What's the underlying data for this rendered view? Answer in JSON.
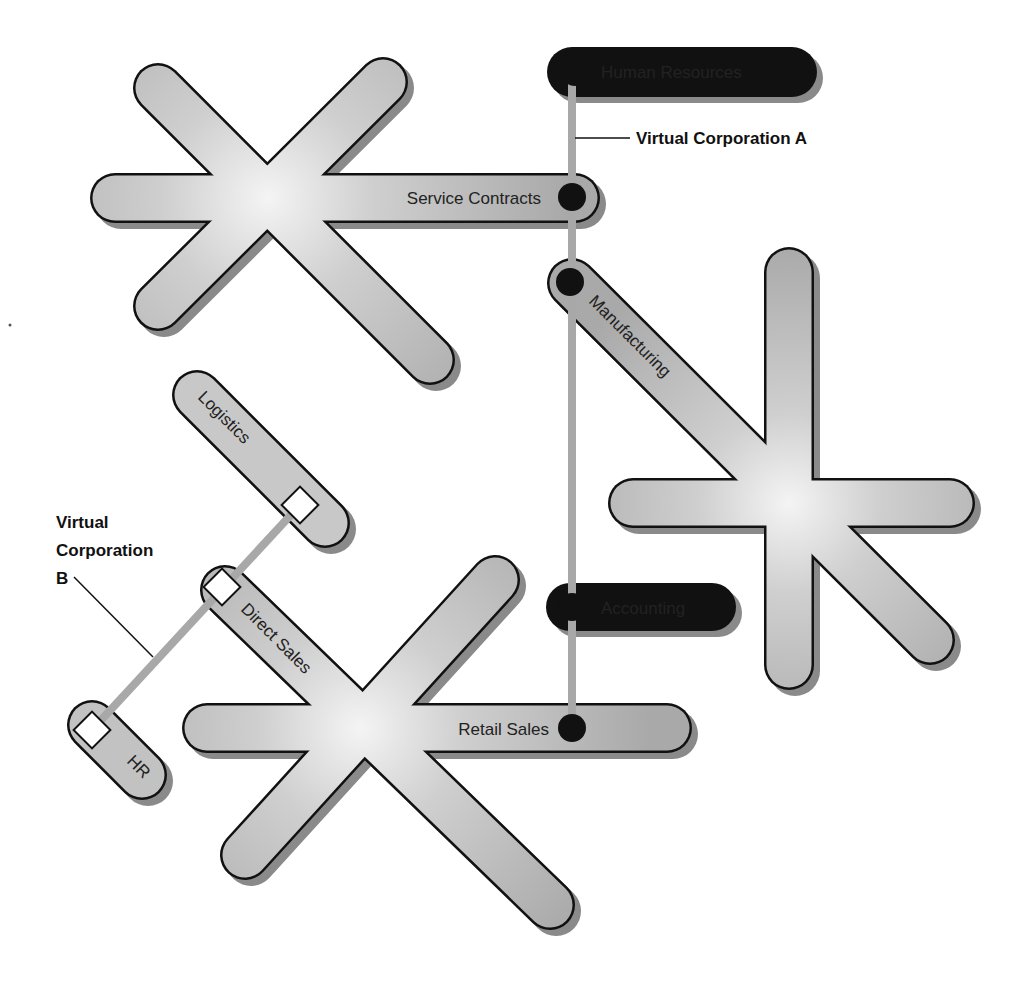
{
  "diagram": {
    "type": "virtual-corporation-network",
    "colors": {
      "background": "#ffffff",
      "arm_fill": "#bdbdbd",
      "arm_highlight": "#f2f2f2",
      "arm_outline": "#111111",
      "shadow": "#8a8a8a",
      "connector": "#a8a8a8",
      "node_a": "#111111",
      "node_b": "#ffffff"
    },
    "callouts": {
      "corp_a": "Virtual Corporation A",
      "corp_b_line1": "Virtual",
      "corp_b_line2": "Corporation",
      "corp_b_line3": "B"
    },
    "nodes": {
      "human_resources": "Human Resources",
      "service_contracts": "Service Contracts",
      "manufacturing": "Manufacturing",
      "accounting": "Accounting",
      "retail_sales": "Retail Sales",
      "logistics": "Logistics",
      "direct_sales": "Direct Sales",
      "hr": "HR"
    },
    "corporations": [
      {
        "name": "Virtual Corporation A",
        "marker": "black-circle",
        "members": [
          "Human Resources",
          "Service Contracts",
          "Manufacturing",
          "Accounting",
          "Retail Sales"
        ]
      },
      {
        "name": "Virtual Corporation B",
        "marker": "white-square",
        "members": [
          "Logistics",
          "Direct Sales",
          "HR"
        ]
      }
    ]
  }
}
